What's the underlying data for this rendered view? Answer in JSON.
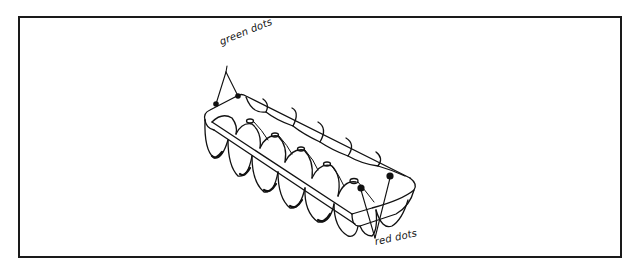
{
  "figure": {
    "labels": {
      "green": "green dots",
      "red": "red dots"
    },
    "colors": {
      "line": "#111111",
      "frame": "#1a1a1a",
      "background": "#ffffff"
    },
    "annotations": [
      {
        "id": "green-dots",
        "text": "green dots",
        "points_to": 2
      },
      {
        "id": "red-dots",
        "text": "red dots",
        "points_to": 2
      }
    ]
  }
}
